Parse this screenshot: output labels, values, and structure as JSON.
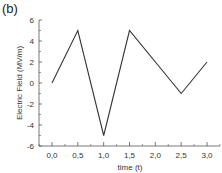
{
  "panel_label": "(b)",
  "chart_data": {
    "type": "line",
    "title": "",
    "xlabel": "time (t)",
    "ylabel": "Electric Field (MV/m)",
    "x": [
      0.0,
      0.5,
      1.0,
      1.5,
      2.5,
      3.0
    ],
    "series": [
      {
        "name": "Electric Field",
        "values": [
          0,
          5,
          -5,
          5,
          -1,
          2
        ],
        "color": "#333333"
      }
    ],
    "xlim": [
      -0.25,
      3.2
    ],
    "ylim": [
      -6,
      6
    ],
    "xticks": [
      0.0,
      0.5,
      1.0,
      1.5,
      2.0,
      2.5,
      3.0
    ],
    "xtick_labels": [
      "0,0",
      "0,5",
      "1,0",
      "1,5",
      "2,0",
      "2,5",
      "3,0"
    ],
    "yticks": [
      -6,
      -4,
      -2,
      0,
      2,
      4,
      6
    ],
    "ytick_labels": [
      "-6",
      "-4",
      "-2",
      "0",
      "2",
      "4",
      "6"
    ],
    "grid": false,
    "legend": null
  }
}
